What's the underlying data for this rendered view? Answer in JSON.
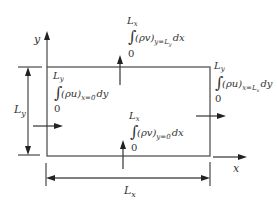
{
  "figure": {
    "axes": {
      "x_label": "x",
      "y_label": "y"
    },
    "dimensions": {
      "width_label_base": "L",
      "width_label_sub": "x",
      "height_label_base": "L",
      "height_label_sub": "y"
    },
    "fluxes": {
      "top": {
        "upper_limit_base": "L",
        "upper_limit_sub": "x",
        "lower_limit": "0",
        "integrand": "(ρv)",
        "subscript": "y=L",
        "subscript_sub": "y",
        "differential": "dx"
      },
      "bottom": {
        "upper_limit_base": "L",
        "upper_limit_sub": "x",
        "lower_limit": "0",
        "integrand": "(ρv)",
        "subscript": "y=0",
        "differential": "dx"
      },
      "left": {
        "upper_limit_base": "L",
        "upper_limit_sub": "y",
        "lower_limit": "0",
        "integrand": "(ρu)",
        "subscript": "x=0",
        "differential": "dy"
      },
      "right": {
        "upper_limit_base": "L",
        "upper_limit_sub": "y",
        "lower_limit": "0",
        "integrand": "(ρu)",
        "subscript": "x=L",
        "subscript_sub": "x",
        "differential": "dy"
      }
    },
    "integral_symbol": "∫"
  }
}
